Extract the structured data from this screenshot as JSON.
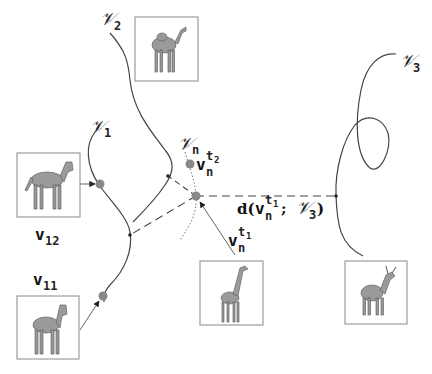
{
  "figure": {
    "type": "video-trajectory-distance-diagram",
    "curves": [
      {
        "id": "V1",
        "label": "𝒱",
        "subscript": "1"
      },
      {
        "id": "V2",
        "label": "𝒱",
        "subscript": "2"
      },
      {
        "id": "V3",
        "label": "𝒱",
        "subscript": "3"
      },
      {
        "id": "Vn",
        "label": "𝒱",
        "subscript": "n"
      }
    ],
    "points": [
      {
        "id": "vn_t1",
        "label": "v",
        "subscript": "n",
        "superscript": "t",
        "superscript_sub": "1"
      },
      {
        "id": "vn_t2",
        "label": "v",
        "subscript": "n",
        "superscript": "t",
        "superscript_sub": "2"
      },
      {
        "id": "v11",
        "label": "v",
        "subscript": "11"
      },
      {
        "id": "v12",
        "label": "v",
        "subscript": "12"
      }
    ],
    "distance_label": {
      "prefix": "d(",
      "var": "v",
      "subscript": "n",
      "superscript": "t",
      "superscript_sub": "1",
      "separator": " ; ",
      "set": "𝒱",
      "set_subscript": "3",
      "suffix": ")"
    },
    "thumbnails": [
      {
        "id": "camel",
        "animal": "camel",
        "attached_to": "V2"
      },
      {
        "id": "horse-top",
        "animal": "horse",
        "attached_to": "v12"
      },
      {
        "id": "horse-bottom",
        "animal": "horse",
        "attached_to": "v11"
      },
      {
        "id": "giraffe",
        "animal": "giraffe",
        "attached_to": "vn_t1"
      },
      {
        "id": "goat",
        "animal": "goat",
        "attached_to": "V3"
      }
    ],
    "colors": {
      "curve": "#444444",
      "point": "#888888",
      "dashed": "#444444",
      "dotted": "#777777",
      "frame": "#888888"
    }
  }
}
